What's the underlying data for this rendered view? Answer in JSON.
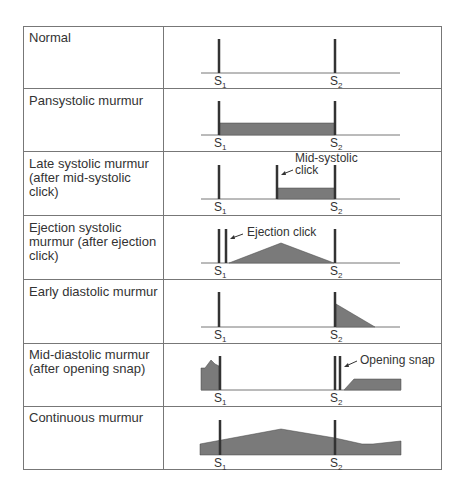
{
  "figure": {
    "rows": [
      {
        "label": "Normal"
      },
      {
        "label": "Pansystolic murmur"
      },
      {
        "label": "Late systolic murmur (after mid-systolic click)"
      },
      {
        "label": "Ejection systolic murmur (after ejection click)"
      },
      {
        "label": "Early diastolic murmur"
      },
      {
        "label": "Mid-diastolic murmur (after opening snap)"
      },
      {
        "label": "Continuous murmur"
      }
    ],
    "heart_sounds": {
      "s1": "S",
      "s1_sub": "1",
      "s2": "S",
      "s2_sub": "2"
    },
    "annotations": {
      "mid_systolic_1": "Mid-systolic",
      "mid_systolic_2": "click",
      "ejection_click": "Ejection click",
      "opening_snap": "Opening snap"
    },
    "colors": {
      "fill": "#7a7a7a",
      "bar": "#333333",
      "line": "#777777"
    }
  }
}
